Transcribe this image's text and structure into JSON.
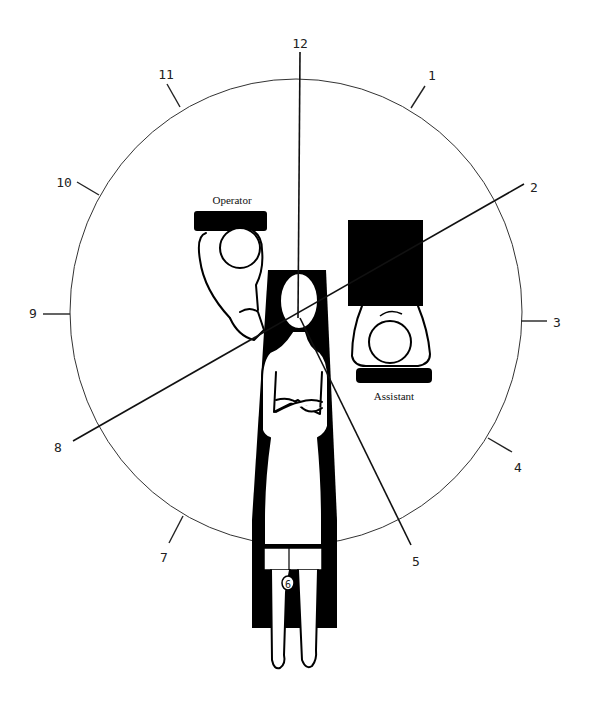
{
  "diagram": {
    "type": "clock-position-diagram",
    "clock_numbers": [
      {
        "label": "12",
        "x": 300,
        "y": 48
      },
      {
        "label": "1",
        "x": 432,
        "y": 80
      },
      {
        "label": "2",
        "x": 530,
        "y": 191
      },
      {
        "label": "3",
        "x": 555,
        "y": 327
      },
      {
        "label": "4",
        "x": 517,
        "y": 471
      },
      {
        "label": "5",
        "x": 416,
        "y": 565
      },
      {
        "label": "6",
        "x": 288,
        "y": 587
      },
      {
        "label": "7",
        "x": 164,
        "y": 561
      },
      {
        "label": "8",
        "x": 58,
        "y": 451
      },
      {
        "label": "9",
        "x": 33,
        "y": 317
      },
      {
        "label": "10",
        "x": 64,
        "y": 186
      },
      {
        "label": "11",
        "x": 166,
        "y": 78
      }
    ],
    "labels": {
      "operator": "Operator",
      "assistant": "Assistant"
    },
    "colors": {
      "ink": "#000000",
      "background": "#ffffff"
    }
  }
}
